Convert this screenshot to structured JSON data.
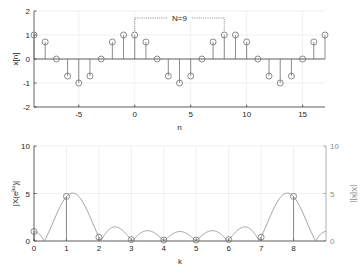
{
  "chart_data": [
    {
      "type": "stem",
      "title": "",
      "xlabel": "n",
      "ylabel": "x[n]",
      "xlim": [
        -9,
        17
      ],
      "ylim": [
        -2,
        2
      ],
      "xticks": [
        -5,
        0,
        5,
        10,
        15
      ],
      "yticks": [
        -2,
        -1,
        0,
        1,
        2
      ],
      "xtick_labels": [
        "-5",
        "0",
        "5",
        "10",
        "15"
      ],
      "ytick_labels": [
        "-2",
        "-1",
        "0",
        "1",
        "2"
      ],
      "grid": true,
      "x": [
        -9,
        -8,
        -7,
        -6,
        -5,
        -4,
        -3,
        -2,
        -1,
        0,
        1,
        2,
        3,
        4,
        5,
        6,
        7,
        8,
        9,
        10,
        11,
        12,
        13,
        14,
        15,
        16,
        17
      ],
      "values": [
        1,
        0.71,
        0,
        -0.71,
        -1,
        -0.71,
        0,
        0.71,
        1,
        1,
        0.71,
        0,
        -0.71,
        -1,
        -0.71,
        0,
        0.71,
        1,
        1,
        0.71,
        0,
        -0.71,
        -1,
        -0.71,
        0,
        0.71,
        1
      ],
      "annotation": {
        "text": "N=9",
        "from_n": 0,
        "to_n": 8
      }
    },
    {
      "type": "line+stem",
      "title": "",
      "xlabel": "k",
      "ylabel": "|X(e^jω)|",
      "ylabel_right": "|X[k]|",
      "xlim": [
        0,
        9
      ],
      "ylim": [
        0,
        10
      ],
      "xticks": [
        0,
        1,
        2,
        3,
        4,
        5,
        6,
        7,
        8
      ],
      "xtick_labels": [
        "0",
        "1",
        "2",
        "3",
        "4",
        "5",
        "6",
        "7",
        "8"
      ],
      "yticks": [
        0,
        5,
        10
      ],
      "ytick_labels": [
        "0",
        "5",
        "10"
      ],
      "ytick_labels_right": [
        "0",
        "5",
        "10"
      ],
      "grid": true,
      "series": [
        {
          "name": "|X[k]|",
          "k": [
            0,
            1,
            2,
            3,
            4,
            5,
            6,
            7,
            8
          ],
          "values": [
            1.0,
            4.7,
            0.4,
            0.15,
            0.1,
            0.1,
            0.15,
            0.4,
            4.7
          ]
        },
        {
          "name": "|X(e^jω)|",
          "description": "continuous DTFT magnitude of one period (n=0..8), plotted vs k = 9ω/2π",
          "signal": [
            1,
            0.7071,
            0,
            -0.7071,
            -1,
            -0.7071,
            0,
            0.7071,
            1
          ]
        }
      ]
    }
  ]
}
